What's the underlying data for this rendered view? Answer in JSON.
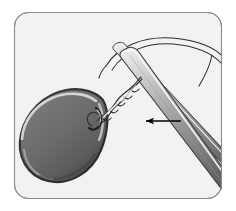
{
  "figure": {
    "title": "Attaching a teardrop sinker to a rod tip",
    "type": "line-illustration",
    "frame": {
      "shape": "rounded-rectangle",
      "x": 14,
      "y": 12,
      "width": 208,
      "height": 187,
      "corner_radius": 14,
      "border_color": "#8c8c8c",
      "border_width": 1,
      "fill_color": "#f2f2f2",
      "outside_color": "#ffffff"
    },
    "objects": [
      {
        "name": "sinker",
        "label": "teardrop sinker",
        "body_color": "#6b6b6b",
        "shadow_color": "#4d4d4d",
        "outline_color": "#2b2b2b",
        "highlight_color": "#d6d6d6",
        "shape": "pear-teardrop",
        "center_x": 62,
        "center_y": 133,
        "width": 86,
        "height": 80
      },
      {
        "name": "twisted-wire",
        "label": "twisted wire leader",
        "stroke_color": "#3a3a3a",
        "fill_color": "#f7f7f7",
        "twist_count": 5,
        "start_x": 100,
        "start_y": 116,
        "end_x": 136,
        "end_y": 76
      },
      {
        "name": "rod-upper",
        "label": "upper rod section",
        "fill_top": "#e8e8e8",
        "fill_bottom": "#6f6f6f",
        "outline_color": "#3d3d3d",
        "tip_x": 117,
        "tip_y": 44
      },
      {
        "name": "rod-lower",
        "label": "lower rod section",
        "fill_top": "#ededed",
        "fill_bottom": "#5f5f5f",
        "outline_color": "#3d3d3d",
        "tip_x": 124,
        "tip_y": 50
      },
      {
        "name": "fishing-line",
        "label": "fishing line loop",
        "stroke_color": "#2e2e2e",
        "stroke_width": 1,
        "shape": "arc-loop-over-rod"
      },
      {
        "name": "direction-arrow",
        "label": "direction of pull",
        "color": "#000000",
        "points": "left",
        "tail_x": 180,
        "tail_y": 121,
        "head_x": 144,
        "head_y": 121
      }
    ]
  },
  "colors": {
    "page_background": "#ffffff",
    "panel_background": "#f2f2f2",
    "panel_border": "#8c8c8c",
    "sinker_body": "#6b6b6b",
    "sinker_dark": "#4d4d4d",
    "outline": "#2b2b2b",
    "arrow": "#000000",
    "rod_light": "#ebebeb",
    "rod_dark": "#5f5f5f"
  }
}
